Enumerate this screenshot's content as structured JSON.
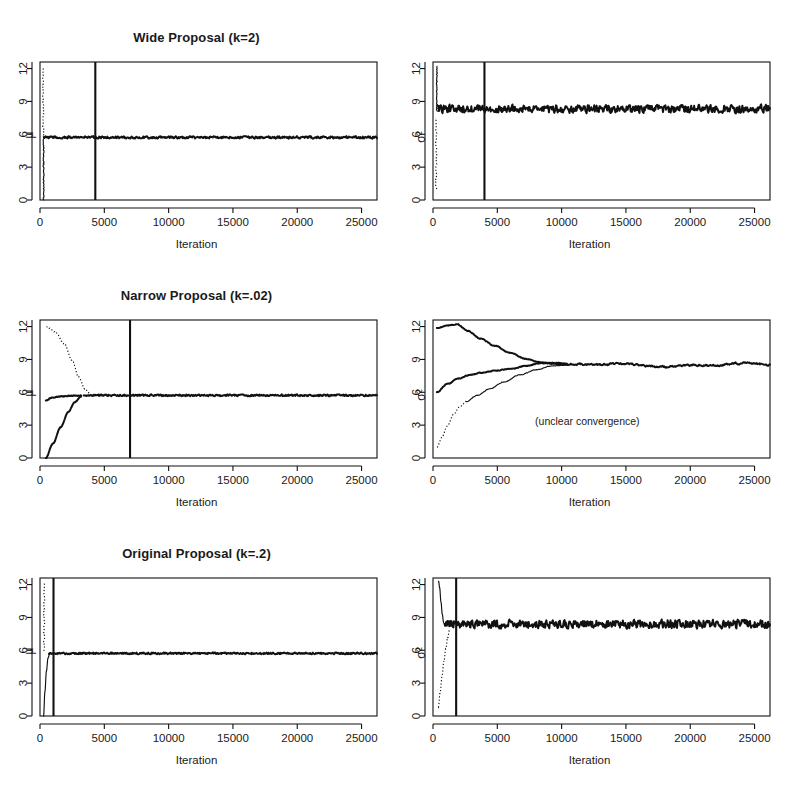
{
  "figure": {
    "x_axis_label": "Iteration",
    "y_label_mu": "μ",
    "y_label_sigma2": "σ²",
    "annotation_unclear": "(unclear convergence)"
  },
  "panels": [
    {
      "id": "wide-mu",
      "title": "Wide Proposal (k=2)",
      "ylabel": "μ",
      "xlabel": "Iteration",
      "burnin": 4300,
      "annotation": ""
    },
    {
      "id": "wide-sigma2",
      "title": "",
      "ylabel": "σ²",
      "xlabel": "Iteration",
      "burnin": 4000,
      "annotation": ""
    },
    {
      "id": "narrow-mu",
      "title": "Narrow Proposal (k=.02)",
      "ylabel": "μ",
      "xlabel": "Iteration",
      "burnin": 7000,
      "annotation": ""
    },
    {
      "id": "narrow-sigma2",
      "title": "",
      "ylabel": "σ²",
      "xlabel": "Iteration",
      "burnin": null,
      "annotation": "(unclear convergence)"
    },
    {
      "id": "original-mu",
      "title": "Original Proposal (k=.2)",
      "ylabel": "μ",
      "xlabel": "Iteration",
      "burnin": 1050,
      "annotation": ""
    },
    {
      "id": "original-sigma2",
      "title": "",
      "ylabel": "σ²",
      "xlabel": "Iteration",
      "burnin": 1800,
      "annotation": ""
    }
  ],
  "axes": {
    "x_ticks": [
      0,
      5000,
      10000,
      15000,
      20000,
      25000
    ],
    "x_tick_labels": [
      "0",
      "5000",
      "10000",
      "15000",
      "20000",
      "25000"
    ],
    "y_ticks": [
      0,
      3,
      6,
      9,
      12
    ],
    "y_tick_labels": [
      "0",
      "3",
      "6",
      "9",
      "12"
    ],
    "xlim": [
      0,
      26200
    ],
    "ylim": [
      0,
      12.6
    ]
  },
  "chart_data": {
    "type": "line",
    "xlabel": "Iteration",
    "ylabel": "",
    "xlim": [
      0,
      26200
    ],
    "ylim": [
      0,
      12.6
    ],
    "grid": false,
    "legend": "none",
    "x_ticks": [
      0,
      5000,
      10000,
      15000,
      20000,
      25000
    ],
    "y_ticks": [
      0,
      3,
      6,
      9,
      12
    ],
    "panels": [
      {
        "panel": "wide-mu",
        "title": "Wide Proposal (k=2)",
        "ylabel": "mu",
        "stationary_value": 5.7,
        "noise_amplitude": 0.12,
        "burnin_marker": 4300,
        "series": [
          {
            "name": "chain-1-dotted-start-12",
            "style": "dotted",
            "x": [
              60,
              90,
              120,
              150,
              180,
              210,
              240
            ],
            "y": [
              12.0,
              10.2,
              8.6,
              7.3,
              6.5,
              6.0,
              5.75
            ]
          },
          {
            "name": "chain-2-solid-start-0",
            "style": "solid",
            "x": [
              60,
              110,
              160,
              210,
              250
            ],
            "y": [
              0.0,
              1.6,
              3.4,
              5.0,
              5.7
            ]
          },
          {
            "name": "stationary-trace",
            "style": "noisy-solid",
            "x": [
              250,
              26200
            ],
            "y": [
              5.7,
              5.7
            ]
          }
        ]
      },
      {
        "panel": "wide-sigma2",
        "title": "",
        "ylabel": "sigma^2",
        "stationary_value": 8.3,
        "noise_amplitude": 0.42,
        "burnin_marker": 4000,
        "series": [
          {
            "name": "chain-1-dotted-start-1",
            "style": "dotted",
            "x": [
              60,
              60,
              60,
              60
            ],
            "y": [
              1.0,
              3.5,
              6.0,
              7.6
            ]
          },
          {
            "name": "chain-2-solid-start-12",
            "style": "solid",
            "x": [
              90,
              110,
              140
            ],
            "y": [
              12.2,
              10.0,
              8.4
            ]
          },
          {
            "name": "stationary-trace",
            "style": "noisy-solid",
            "x": [
              150,
              26200
            ],
            "y": [
              8.3,
              8.3
            ]
          }
        ]
      },
      {
        "panel": "narrow-mu",
        "title": "Narrow Proposal (k=.02)",
        "ylabel": "mu",
        "stationary_value": 5.7,
        "noise_amplitude": 0.1,
        "burnin_marker": 7000,
        "series": [
          {
            "name": "chain-1-dotted-start-12",
            "style": "dotted",
            "x": [
              400,
              900,
              1500,
              2100,
              2600,
              3000,
              3400,
              3800
            ],
            "y": [
              12.0,
              11.6,
              10.7,
              9.2,
              7.7,
              6.7,
              6.1,
              5.8
            ]
          },
          {
            "name": "chain-2-solid-start-0",
            "style": "solid",
            "x": [
              400,
              900,
              1400,
              1900,
              2400,
              2900,
              3300
            ],
            "y": [
              0.0,
              1.2,
              2.6,
              3.9,
              4.9,
              5.4,
              5.65
            ]
          },
          {
            "name": "chain-3-flat-start-5.3",
            "style": "solid",
            "x": [
              400,
              900,
              1600,
              2400,
              3200
            ],
            "y": [
              5.3,
              5.5,
              5.6,
              5.65,
              5.7
            ]
          },
          {
            "name": "stationary-trace",
            "style": "noisy-solid",
            "x": [
              3800,
              26200
            ],
            "y": [
              5.7,
              5.7
            ]
          }
        ]
      },
      {
        "panel": "narrow-sigma2",
        "title": "",
        "ylabel": "sigma^2",
        "stationary_value": 8.4,
        "noise_amplitude": 0.16,
        "burnin_marker": null,
        "annotation": "(unclear convergence)",
        "series": [
          {
            "name": "chain-1-from-12-descending",
            "style": "solid",
            "x": [
              300,
              1200,
              2000,
              3000,
              4200,
              5400,
              6600,
              7600,
              8600,
              9600,
              10500
            ],
            "y": [
              11.9,
              12.1,
              12.2,
              11.5,
              10.8,
              10.2,
              9.6,
              9.1,
              8.8,
              8.6,
              8.5
            ]
          },
          {
            "name": "chain-2-from-6-ascending",
            "style": "solid",
            "x": [
              300,
              1200,
              2200,
              3200,
              4200,
              5200,
              6200,
              7200,
              8200,
              9200,
              10300
            ],
            "y": [
              6.0,
              6.7,
              7.2,
              7.6,
              7.8,
              8.0,
              8.1,
              8.3,
              8.6,
              8.7,
              8.6
            ]
          },
          {
            "name": "chain-3-dotted-from-1-ascending",
            "style": "dotted-then-solid",
            "x": [
              300,
              900,
              1500,
              2200,
              3000,
              3900,
              4900,
              6000,
              7200,
              8400,
              9600,
              10500
            ],
            "y": [
              1.0,
              2.0,
              3.1,
              4.3,
              5.0,
              5.6,
              6.3,
              7.0,
              7.7,
              8.2,
              8.5,
              8.5
            ]
          },
          {
            "name": "merged-trace",
            "style": "noisy-solid-wiggle",
            "x": [
              10500,
              26200
            ],
            "y": [
              8.5,
              8.45
            ]
          }
        ]
      },
      {
        "panel": "original-mu",
        "title": "Original Proposal (k=.2)",
        "ylabel": "mu",
        "stationary_value": 5.7,
        "noise_amplitude": 0.1,
        "burnin_marker": 1050,
        "series": [
          {
            "name": "chain-1-dotted-start-12",
            "style": "dotted",
            "x": [
              200,
              250,
              320,
              420,
              520,
              620
            ],
            "y": [
              12.1,
              11.2,
              9.4,
              7.6,
              6.4,
              5.85
            ]
          },
          {
            "name": "chain-2-solid-start-0",
            "style": "solid",
            "x": [
              200,
              280,
              400,
              520,
              620
            ],
            "y": [
              0.0,
              1.9,
              3.9,
              5.2,
              5.7
            ]
          },
          {
            "name": "stationary-trace",
            "style": "noisy-solid",
            "x": [
              650,
              26200
            ],
            "y": [
              5.7,
              5.7
            ]
          }
        ]
      },
      {
        "panel": "original-sigma2",
        "title": "",
        "ylabel": "sigma^2",
        "stationary_value": 8.4,
        "noise_amplitude": 0.45,
        "burnin_marker": 1800,
        "series": [
          {
            "name": "chain-1-dotted-start-1",
            "style": "dotted",
            "x": [
              300,
              400,
              520,
              650,
              780,
              900,
              1000
            ],
            "y": [
              0.9,
              2.3,
              3.8,
              5.2,
              6.3,
              7.3,
              7.9
            ]
          },
          {
            "name": "chain-2-solid-start-12",
            "style": "solid",
            "x": [
              300,
              400,
              500,
              600,
              700
            ],
            "y": [
              12.3,
              11.6,
              10.3,
              9.2,
              8.5
            ]
          },
          {
            "name": "stationary-trace",
            "style": "noisy-solid",
            "x": [
              800,
              26200
            ],
            "y": [
              8.4,
              8.4
            ]
          }
        ]
      }
    ]
  }
}
